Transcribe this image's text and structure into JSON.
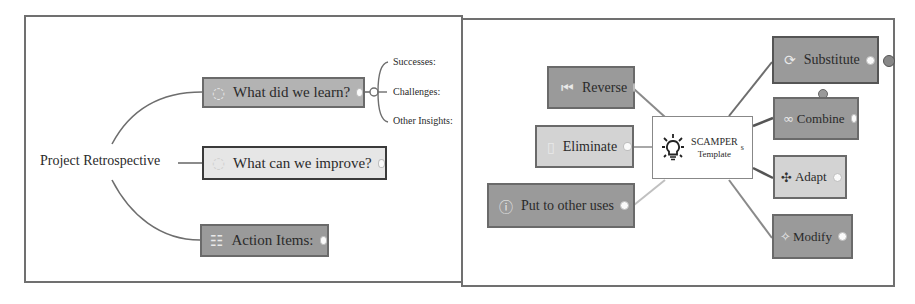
{
  "left_diagram": {
    "root": "Project Retrospective",
    "branches": [
      {
        "label": "What did we learn?",
        "icon": "loop-icon"
      },
      {
        "label": "What can we improve?",
        "icon": "loop-icon"
      },
      {
        "label": "Action Items:",
        "icon": "list-icon"
      }
    ],
    "sub_items": [
      "Successes:",
      "Challenges:",
      "Other Insights:"
    ]
  },
  "right_diagram": {
    "center": {
      "line1": "SCAMPER",
      "line2": "Template",
      "icon": "lightbulb-icon",
      "marker": "s"
    },
    "left_nodes": [
      {
        "label": "Reverse",
        "icon": "rewind-icon"
      },
      {
        "label": "Eliminate",
        "icon": "trash-icon"
      },
      {
        "label": "Put to other uses",
        "icon": "question-icon"
      }
    ],
    "right_nodes": [
      {
        "label": "Substitute",
        "icon": "swap-icon"
      },
      {
        "label": "Combine",
        "icon": "link-icon"
      },
      {
        "label": "Adapt",
        "icon": "adapt-icon"
      },
      {
        "label": "Modify",
        "icon": "wand-icon"
      }
    ]
  },
  "colors": {
    "frame": "#707070",
    "dark_node": "#9a9a9a",
    "light_node": "#d3d3d3",
    "line": "#6e6e6e"
  }
}
